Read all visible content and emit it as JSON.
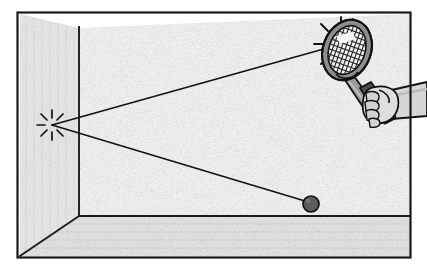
{
  "illustration": {
    "title": "Squash ball rebound off the front wall",
    "caption": "",
    "style": "black-and-white line drawing with gray shading",
    "canvas": {
      "width": 427,
      "height": 274,
      "background": "#ffffff"
    }
  },
  "colors": {
    "ink": "#1a1a1a",
    "frame_border": "#1a1a1a",
    "back_wall_fill": "#f2f2f2",
    "side_wall_fill": "#e6e6e6",
    "floor_fill": "#e2e2e2",
    "racket_frame": "#8a8a8a",
    "racket_frame_dark": "#6f6f6f",
    "racket_string_fill": "#f5f5f5",
    "racket_grip": "#4a4a4a",
    "racket_shaft": "#9a9a9a",
    "hand_fill": "#dcdcdc",
    "arm_fill": "#d2d2d2",
    "ball_fill": "#5c5c5c",
    "trajectory_line": "#111111"
  },
  "scene": {
    "room": {
      "name": "squash court interior",
      "outer_frame": {
        "x": 17,
        "y": 12,
        "width": 395,
        "height": 246
      },
      "back_wall_label": "front wall",
      "side_wall_label": "left side wall",
      "floor_label": "court floor",
      "corner_vertical_x": 79,
      "floor_line_y": 216,
      "bottom_left_corner": {
        "x": 20,
        "y": 256
      }
    },
    "impact_wall": {
      "name": "ball impact point on wall",
      "x": 52,
      "y": 125,
      "burst_rays": 8,
      "burst_radius_inner": 7,
      "burst_radius_outer": 15
    },
    "impact_racket": {
      "name": "ball impact point on racket strings",
      "x": 338,
      "y": 45,
      "burst_rays": 8,
      "burst_radius_inner": 14,
      "burst_radius_outer": 24
    },
    "ball": {
      "name": "squash ball",
      "cx": 311,
      "cy": 204,
      "r": 8
    },
    "trajectories": [
      {
        "name": "incoming-shot-path",
        "label": "racket to wall",
        "from": {
          "x": 338,
          "y": 45
        },
        "to": {
          "x": 52,
          "y": 125
        }
      },
      {
        "name": "rebound-path",
        "label": "wall to ball",
        "from": {
          "x": 52,
          "y": 125
        },
        "to": {
          "x": 305,
          "y": 201
        }
      }
    ],
    "racket": {
      "name": "squash racket",
      "head_center": {
        "x": 347,
        "y": 50
      },
      "head_rx": 23,
      "head_ry": 30,
      "head_rotation_deg": 20,
      "string_rows": 9,
      "string_cols": 9,
      "shaft_from": {
        "x": 355,
        "y": 78
      },
      "shaft_to": {
        "x": 375,
        "y": 108
      },
      "grip_from": {
        "x": 370,
        "y": 100
      },
      "grip_to": {
        "x": 385,
        "y": 122
      }
    },
    "hand": {
      "name": "player hand gripping racket",
      "knuckle_count": 4,
      "center": {
        "x": 383,
        "y": 105
      }
    },
    "arm": {
      "name": "player forearm",
      "from": {
        "x": 392,
        "y": 96
      },
      "to": {
        "x": 427,
        "y": 88
      }
    }
  }
}
